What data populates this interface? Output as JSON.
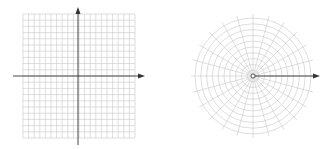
{
  "figure": {
    "panels": [
      {
        "name": "cartesian-grid",
        "type": "rectangular coordinate grid",
        "x_lines": 20,
        "y_lines": 20,
        "axes": [
          "x-axis with arrow right",
          "y-axis with arrow up"
        ]
      },
      {
        "name": "polar-grid",
        "type": "polar coordinate grid",
        "rings": 10,
        "spokes": 24,
        "axes": [
          "polar axis arrow pointing right"
        ]
      }
    ],
    "colors": {
      "grid": "#c8c8c8",
      "axis": "#333333",
      "background": "#ffffff"
    }
  }
}
